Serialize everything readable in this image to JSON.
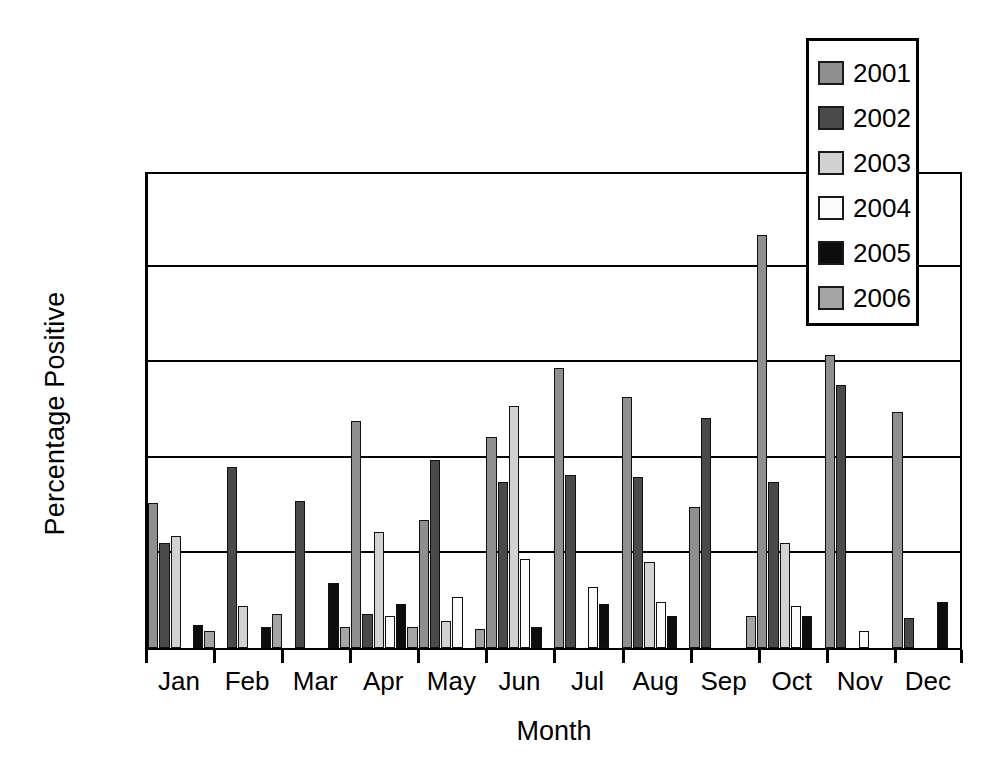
{
  "chart_data": {
    "type": "bar",
    "title": "",
    "xlabel": "Month",
    "ylabel": "Percentage Positive",
    "categories": [
      "Jan",
      "Feb",
      "Mar",
      "Apr",
      "May",
      "Jun",
      "Jul",
      "Aug",
      "Sep",
      "Oct",
      "Nov",
      "Dec"
    ],
    "ylim": [
      0.0,
      2.5
    ],
    "yticks": [
      "0.0",
      "0.5",
      "1.0",
      "1.5",
      "2.0",
      "2.5"
    ],
    "ytick_values": [
      0.0,
      0.5,
      1.0,
      1.5,
      2.0,
      2.5
    ],
    "grid": true,
    "legend_position": "top-right",
    "series": [
      {
        "name": "2001",
        "color": "#8f8f8f",
        "values": [
          0.76,
          null,
          null,
          1.19,
          0.67,
          1.11,
          1.47,
          1.32,
          0.74,
          2.17,
          1.54,
          1.24
        ]
      },
      {
        "name": "2002",
        "color": "#4a4a4a",
        "values": [
          0.55,
          0.95,
          0.77,
          0.18,
          0.99,
          0.87,
          0.91,
          0.9,
          1.21,
          0.87,
          1.38,
          0.16
        ]
      },
      {
        "name": "2003",
        "color": "#d2d2d2",
        "values": [
          0.59,
          0.22,
          null,
          0.61,
          0.14,
          1.27,
          null,
          0.45,
          null,
          0.55,
          null,
          null
        ]
      },
      {
        "name": "2004",
        "color": "#fbfbfb",
        "values": [
          null,
          null,
          null,
          0.17,
          0.27,
          0.47,
          0.32,
          0.24,
          null,
          0.22,
          0.09,
          null
        ]
      },
      {
        "name": "2005",
        "color": "#0d0d0d",
        "values": [
          0.12,
          0.11,
          0.34,
          0.23,
          null,
          0.11,
          0.23,
          0.17,
          null,
          0.17,
          null,
          0.24
        ]
      },
      {
        "name": "2006",
        "color": "#a5a5a5",
        "values": [
          0.09,
          0.18,
          0.11,
          0.11,
          0.1,
          null,
          null,
          null,
          0.17,
          null,
          null,
          null
        ]
      }
    ]
  },
  "legend": {
    "items": [
      {
        "label": "2001"
      },
      {
        "label": "2002"
      },
      {
        "label": "2003"
      },
      {
        "label": "2004"
      },
      {
        "label": "2005"
      },
      {
        "label": "2006"
      }
    ]
  }
}
